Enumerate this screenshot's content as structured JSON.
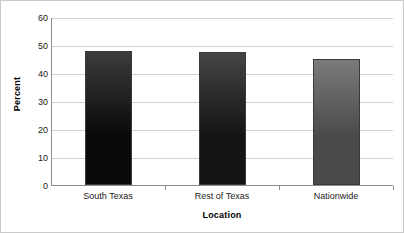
{
  "chart_data": {
    "type": "bar",
    "title": "",
    "subtitle": "",
    "xlabel": "Location",
    "ylabel": "Percent",
    "categories": [
      "South Texas",
      "Rest of Texas",
      "Nationwide"
    ],
    "values": [
      48,
      47.5,
      45
    ],
    "series": [
      {
        "name": "Percent",
        "values": [
          48,
          47.5,
          45
        ]
      }
    ],
    "ylim": [
      0,
      60
    ],
    "yticks": [
      0,
      10,
      20,
      30,
      40,
      50,
      60
    ],
    "ytick_labels": [
      "0",
      "10",
      "20",
      "30",
      "40",
      "50",
      "60"
    ],
    "grid": true,
    "legend": false,
    "legend_position": "none",
    "bar_colors": [
      "#0a0a0a",
      "#141414",
      "#4a4a4a"
    ],
    "bar_top_colors": [
      "#3c3c3c",
      "#454545",
      "#7a7a7a"
    ],
    "bar_border_color": "#3a3a3a",
    "gridline_color": "#d0d0d0",
    "axis_color": "#8c8c8c",
    "background_color": "#ffffff",
    "annotations": []
  }
}
